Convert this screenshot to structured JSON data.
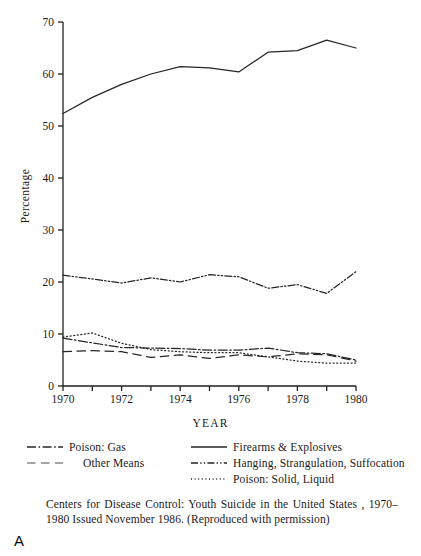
{
  "figure": {
    "panel_letter": "A",
    "caption": "Centers for Disease Control: Youth Suicide in the United States , 1970–1980 Issued November 1986. (Reproduced with permission)"
  },
  "axes": {
    "y_title": "Percentage",
    "x_title": "YEAR"
  },
  "legend": {
    "left": [
      {
        "label": "Poison: Gas",
        "style": "dashdot",
        "indent": false
      },
      {
        "label": "Other Means",
        "style": "longdash",
        "indent": true
      }
    ],
    "right": [
      {
        "label": "Firearms & Explosives",
        "style": "solid",
        "indent": false
      },
      {
        "label": "Hanging, Strangulation, Suffocation",
        "style": "dashdotdot",
        "indent": false
      },
      {
        "label": "Poison: Solid, Liquid",
        "style": "dotted",
        "indent": false
      }
    ]
  },
  "chart_data": {
    "type": "line",
    "title": "",
    "xlabel": "YEAR",
    "ylabel": "Percentage",
    "xlim": [
      1970,
      1980
    ],
    "ylim": [
      0,
      70
    ],
    "ytick_values": [
      0,
      10,
      20,
      30,
      40,
      50,
      60,
      70
    ],
    "xtick_values": [
      1970,
      1971,
      1972,
      1973,
      1974,
      1975,
      1976,
      1977,
      1978,
      1979,
      1980
    ],
    "xtick_labels": [
      "1970",
      "",
      "1972",
      "",
      "1974",
      "",
      "1976",
      "",
      "1978",
      "",
      "1980"
    ],
    "grid": false,
    "legend_position": "below",
    "x": [
      1970,
      1971,
      1972,
      1973,
      1974,
      1975,
      1976,
      1977,
      1978,
      1979,
      1980
    ],
    "series": [
      {
        "name": "Firearms & Explosives",
        "style": "solid",
        "color": "#262626",
        "values": [
          52.4,
          55.5,
          58.0,
          60.0,
          61.4,
          61.2,
          60.4,
          64.2,
          64.5,
          66.5,
          65.0
        ]
      },
      {
        "name": "Hanging, Strangulation, Suffocation",
        "style": "dashdotdot",
        "color": "#262626",
        "values": [
          21.3,
          20.6,
          19.8,
          20.8,
          20.0,
          21.4,
          21.0,
          18.8,
          19.5,
          17.8,
          22.0
        ]
      },
      {
        "name": "Poison: Solid, Liquid",
        "style": "dotted",
        "color": "#262626",
        "values": [
          9.4,
          10.2,
          8.2,
          7.0,
          6.6,
          6.4,
          6.4,
          5.6,
          4.8,
          4.4,
          4.4
        ]
      },
      {
        "name": "Poison: Gas",
        "style": "dashdot",
        "color": "#262626",
        "values": [
          9.2,
          8.3,
          7.4,
          7.3,
          7.2,
          6.9,
          6.9,
          7.3,
          6.4,
          6.2,
          5.0
        ]
      },
      {
        "name": "Other Means",
        "style": "longdash",
        "color": "#262626",
        "values": [
          6.6,
          6.8,
          6.6,
          5.5,
          6.0,
          5.3,
          6.0,
          5.6,
          6.2,
          6.0,
          4.8
        ]
      }
    ]
  }
}
